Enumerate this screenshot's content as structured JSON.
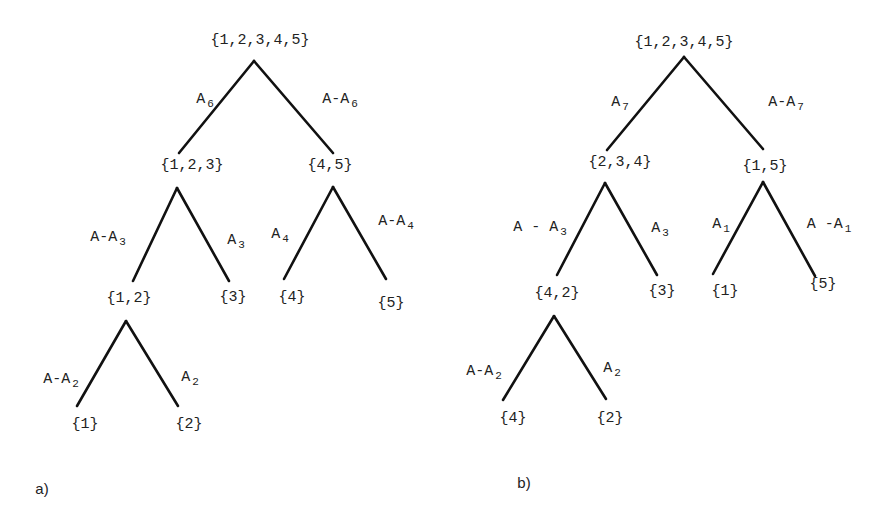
{
  "figure": {
    "trees": [
      {
        "id": "a",
        "caption": "a)",
        "caption_pos": [
          42,
          488
        ],
        "nodes": [
          {
            "label": "{1,2,3,4,5}",
            "pos": [
              260,
              40
            ]
          },
          {
            "label": "{1,2,3}",
            "pos": [
              192,
              165
            ]
          },
          {
            "label": "{4,5}",
            "pos": [
              330,
              165
            ]
          },
          {
            "label": "{1,2}",
            "pos": [
              129,
              298
            ]
          },
          {
            "label": "{3}",
            "pos": [
              233,
              297
            ]
          },
          {
            "label": "{4}",
            "pos": [
              292,
              297
            ]
          },
          {
            "label": "{5}",
            "pos": [
              391,
              303
            ]
          },
          {
            "label": "{1}",
            "pos": [
              85,
              424
            ]
          },
          {
            "label": "{2}",
            "pos": [
              189,
              424
            ]
          }
        ],
        "edges": [
          {
            "from": [
              254,
              61
            ],
            "to": [
              179,
              153
            ],
            "base": "A",
            "sub": "6",
            "label_pos": [
              205,
              100
            ]
          },
          {
            "from": [
              254,
              61
            ],
            "to": [
              333,
              153
            ],
            "base": "A-A",
            "sub": "6",
            "label_pos": [
              340,
              100
            ]
          },
          {
            "from": [
              177,
              188
            ],
            "to": [
              133,
              281
            ],
            "base": "A-A",
            "sub": "3",
            "label_pos": [
              108,
              238
            ]
          },
          {
            "from": [
              177,
              188
            ],
            "to": [
              229,
              281
            ],
            "base": "A",
            "sub": "3",
            "label_pos": [
              236,
              241
            ]
          },
          {
            "from": [
              333,
              187
            ],
            "to": [
              284,
              279
            ],
            "base": "A",
            "sub": "4",
            "label_pos": [
              280,
              235
            ]
          },
          {
            "from": [
              333,
              187
            ],
            "to": [
              386,
              279
            ],
            "base": "A-A",
            "sub": "4",
            "label_pos": [
              396,
              222
            ]
          },
          {
            "from": [
              126,
              321
            ],
            "to": [
              77,
              406
            ],
            "base": "A-A",
            "sub": "2",
            "label_pos": [
              61,
              380
            ]
          },
          {
            "from": [
              126,
              321
            ],
            "to": [
              178,
              406
            ],
            "base": "A",
            "sub": "2",
            "label_pos": [
              190,
              378
            ]
          }
        ]
      },
      {
        "id": "b",
        "caption": "b)",
        "caption_pos": [
          524,
          482
        ],
        "nodes": [
          {
            "label": "{1,2,3,4,5}",
            "pos": [
              684,
              42
            ]
          },
          {
            "label": "{2,3,4}",
            "pos": [
              620,
              162
            ]
          },
          {
            "label": "{1,5}",
            "pos": [
              765,
              166
            ]
          },
          {
            "label": "{4,2}",
            "pos": [
              557,
              293
            ]
          },
          {
            "label": "{3}",
            "pos": [
              662,
              291
            ]
          },
          {
            "label": "{1}",
            "pos": [
              725,
              291
            ]
          },
          {
            "label": "{5}",
            "pos": [
              823,
              284
            ]
          },
          {
            "label": "{4}",
            "pos": [
              513,
              418
            ]
          },
          {
            "label": "{2}",
            "pos": [
              610,
              418
            ]
          }
        ],
        "edges": [
          {
            "from": [
              684,
              57
            ],
            "to": [
              607,
              150
            ],
            "base": "A",
            "sub": "7",
            "label_pos": [
              620,
              103
            ]
          },
          {
            "from": [
              684,
              57
            ],
            "to": [
              763,
              149
            ],
            "base": "A-A",
            "sub": "7",
            "label_pos": [
              786,
              103
            ]
          },
          {
            "from": [
              605,
              183
            ],
            "to": [
              557,
              275
            ],
            "base": "A - A",
            "sub": "3",
            "label_pos": [
              540,
              228
            ]
          },
          {
            "from": [
              605,
              183
            ],
            "to": [
              657,
              275
            ],
            "base": "A",
            "sub": "3",
            "label_pos": [
              660,
              229
            ]
          },
          {
            "from": [
              763,
              182
            ],
            "to": [
              713,
              274
            ],
            "base": "A",
            "sub": "1",
            "label_pos": [
              721,
              225
            ]
          },
          {
            "from": [
              763,
              182
            ],
            "to": [
              815,
              276
            ],
            "base": "A -A",
            "sub": "1",
            "label_pos": [
              829,
              225
            ]
          },
          {
            "from": [
              554,
              316
            ],
            "to": [
              503,
              400
            ],
            "base": "A-A",
            "sub": "2",
            "label_pos": [
              484,
              372
            ]
          },
          {
            "from": [
              554,
              316
            ],
            "to": [
              606,
              399
            ],
            "base": "A",
            "sub": "2",
            "label_pos": [
              612,
              369
            ]
          }
        ]
      }
    ]
  }
}
